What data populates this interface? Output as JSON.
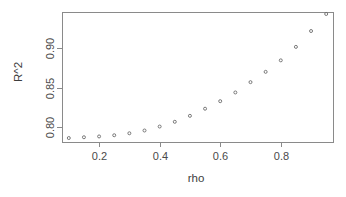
{
  "chart_data": {
    "type": "scatter",
    "title": "",
    "xlabel": "rho",
    "ylabel": "R^2",
    "xlim": [
      0.0775,
      0.9725
    ],
    "ylim": [
      0.7815,
      0.9455
    ],
    "grid": false,
    "legend": null,
    "x_ticks": [
      0.2,
      0.4,
      0.6,
      0.8
    ],
    "x_tick_labels": [
      "0.2",
      "0.4",
      "0.6",
      "0.8"
    ],
    "y_ticks": [
      0.8,
      0.85,
      0.9
    ],
    "y_tick_labels": [
      "0.80",
      "0.85",
      "0.90"
    ],
    "point_symbol": "open-circle",
    "point_color": "#6b6b6b",
    "axis_color": "#8a8a8a",
    "background_color": "#ffffff",
    "x": [
      0.1,
      0.15,
      0.2,
      0.25,
      0.3,
      0.35,
      0.4,
      0.45,
      0.5,
      0.55,
      0.6,
      0.65,
      0.7,
      0.75,
      0.8,
      0.85,
      0.9,
      0.95
    ],
    "y": [
      0.7865,
      0.7875,
      0.7885,
      0.79,
      0.7925,
      0.796,
      0.801,
      0.807,
      0.8145,
      0.8235,
      0.833,
      0.844,
      0.857,
      0.87,
      0.8845,
      0.9015,
      0.9215,
      0.943
    ],
    "series": [
      {
        "name": "R^2 vs rho",
        "values": [
          0.7865,
          0.7875,
          0.7885,
          0.79,
          0.7925,
          0.796,
          0.801,
          0.807,
          0.8145,
          0.8235,
          0.833,
          0.844,
          0.857,
          0.87,
          0.8845,
          0.9015,
          0.9215,
          0.943
        ]
      }
    ],
    "n_points": 18
  },
  "plot_geometry": {
    "box_left": 62,
    "box_right": 333,
    "box_top": 12,
    "box_bottom": 142,
    "xlabel_x": 196,
    "xlabel_y": 182,
    "ylabel_x": 22,
    "ylabel_y": 72
  }
}
